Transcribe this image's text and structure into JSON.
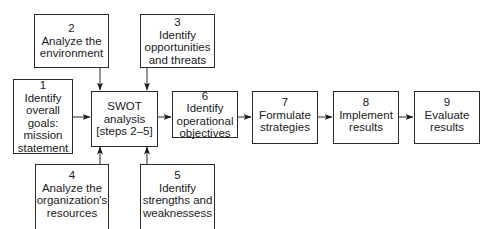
{
  "diagram": {
    "type": "flowchart",
    "nodes": [
      {
        "id": "1",
        "number": "1",
        "lines": [
          "Identify",
          "overall",
          "goals:",
          "mission",
          "statement"
        ]
      },
      {
        "id": "2",
        "number": "2",
        "lines": [
          "Analyze the",
          "environment"
        ]
      },
      {
        "id": "3",
        "number": "3",
        "lines": [
          "Identify",
          "opportunities",
          "and threats"
        ]
      },
      {
        "id": "swot",
        "number": "",
        "lines": [
          "SWOT",
          "analysis",
          "[steps 2–5]"
        ]
      },
      {
        "id": "4",
        "number": "4",
        "lines": [
          "Analyze the",
          "organization's",
          "resources"
        ]
      },
      {
        "id": "5",
        "number": "5",
        "lines": [
          "Identify",
          "strengths and",
          "weaknessess"
        ]
      },
      {
        "id": "6",
        "number": "6",
        "lines": [
          "Identify",
          "operational",
          "objectives"
        ]
      },
      {
        "id": "7",
        "number": "7",
        "lines": [
          "Formulate",
          "strategies"
        ]
      },
      {
        "id": "8",
        "number": "8",
        "lines": [
          "Implement",
          "results"
        ]
      },
      {
        "id": "9",
        "number": "9",
        "lines": [
          "Evaluate",
          "results"
        ]
      }
    ],
    "edges": [
      {
        "from": "1",
        "to": "swot"
      },
      {
        "from": "2",
        "to": "swot"
      },
      {
        "from": "3",
        "to": "swot"
      },
      {
        "from": "4",
        "to": "swot"
      },
      {
        "from": "5",
        "to": "swot"
      },
      {
        "from": "swot",
        "to": "6"
      },
      {
        "from": "6",
        "to": "7"
      },
      {
        "from": "7",
        "to": "8"
      },
      {
        "from": "8",
        "to": "9"
      }
    ],
    "colors": {
      "line": "#2a2a2a",
      "background": "#ffffff",
      "text": "#1a1a1a"
    }
  }
}
